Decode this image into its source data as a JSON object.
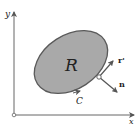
{
  "diagram": {
    "title": "",
    "axes": {
      "x_label": "x",
      "y_label": "y",
      "origin_marker": "open-circle"
    },
    "region": {
      "label": "R",
      "fill": "#a9a9a9",
      "stroke": "#555555"
    },
    "curve": {
      "label": "C",
      "orientation": "counterclockwise-arrow"
    },
    "vectors": [
      {
        "label": "r'",
        "meaning": "tangent vector"
      },
      {
        "label": "n",
        "meaning": "outward normal vector"
      }
    ],
    "colors": {
      "axis": "#555555",
      "text": "#222222",
      "background": "#ffffff"
    }
  }
}
